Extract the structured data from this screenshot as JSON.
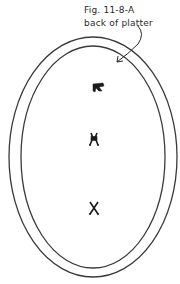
{
  "figure": {
    "label": "Fig. 11-8-A",
    "description": "back of platter",
    "colors": {
      "ink": "#2a2a2a",
      "background": "#ffffff"
    },
    "outer_rim": {
      "cx": 93,
      "cy": 157,
      "rx": 84,
      "ry": 120
    },
    "inner_rim": {
      "cx": 93,
      "cy": 157,
      "rx": 72,
      "ry": 111
    },
    "marks": [
      {
        "name": "top-mark",
        "x": 100,
        "y": 87
      },
      {
        "name": "middle-mark",
        "x": 94,
        "y": 138
      },
      {
        "name": "bottom-mark",
        "x": 94,
        "y": 208
      }
    ]
  }
}
